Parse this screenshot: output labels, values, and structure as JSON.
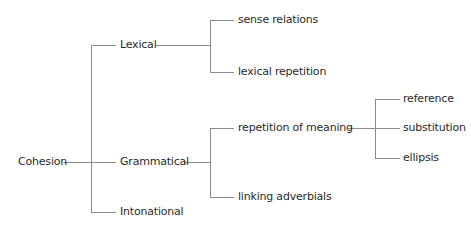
{
  "diagram": {
    "root": {
      "label": "Cohesion"
    },
    "level1": [
      {
        "label": "Lexical"
      },
      {
        "label": "Grammatical"
      },
      {
        "label": "Intonational"
      }
    ],
    "lexical_children": [
      {
        "label": "sense relations"
      },
      {
        "label": "lexical repetition"
      }
    ],
    "grammatical_children": [
      {
        "label": "repetition of meaning"
      },
      {
        "label": "linking adverbials"
      }
    ],
    "repetition_children": [
      {
        "label": "reference"
      },
      {
        "label": "substitution"
      },
      {
        "label": "ellipsis"
      }
    ],
    "line_color": "#8a8a8a",
    "text_color": "#2a2a2a"
  }
}
